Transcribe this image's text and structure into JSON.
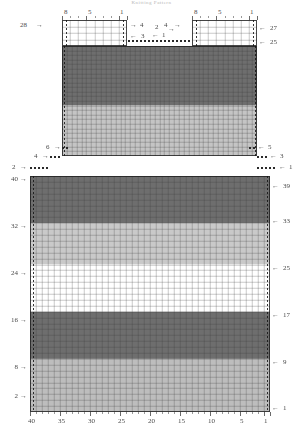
{
  "chart": {
    "title": "Knitting Pattern",
    "kind": "stitch-chart",
    "top_panel": {
      "left_block": {
        "column_labels": [
          "8",
          "5",
          "1"
        ],
        "row_label_left": "28",
        "row_labels_right": [
          "4",
          "3"
        ],
        "columns": 8,
        "rows": 4
      },
      "right_block": {
        "column_labels": [
          "8",
          "5",
          "1"
        ],
        "row_labels_left": [
          "4",
          "2"
        ],
        "row_labels_right": [
          "27",
          "25"
        ],
        "columns": 8,
        "rows": 4
      },
      "center_markers": [
        "1",
        "2"
      ]
    },
    "mid_panel": {
      "left_step_labels": [
        "6",
        "4",
        "2"
      ],
      "right_step_labels": [
        "5",
        "3",
        "1"
      ],
      "left_row_label": "40",
      "right_row_label": "39"
    },
    "main_grid": {
      "columns": 40,
      "rows": 40,
      "column_labels_bottom": [
        "40",
        "35",
        "30",
        "25",
        "20",
        "15",
        "10",
        "5",
        "1"
      ],
      "row_labels_left": [
        "40",
        "32",
        "24",
        "16",
        "8",
        "2"
      ],
      "row_labels_right": [
        "39",
        "33",
        "25",
        "17",
        "9",
        "1"
      ]
    }
  },
  "chart_data": {
    "type": "heatmap",
    "title": "Knitting Pattern",
    "xlabel": "",
    "ylabel": "",
    "grid": true,
    "legend": "none",
    "columns": 40,
    "rows": 40,
    "x_tick_labels": [
      "40",
      "35",
      "30",
      "25",
      "20",
      "15",
      "10",
      "5",
      "1"
    ],
    "y_tick_labels_left": [
      "40",
      "32",
      "24",
      "16",
      "8",
      "2"
    ],
    "y_tick_labels_right": [
      "39",
      "33",
      "25",
      "17",
      "9",
      "1"
    ],
    "colors": {
      "dark": "#6e6e6e",
      "mid": "#b4b4b4",
      "light": "#d6d6d6",
      "white": "#ffffff",
      "gridline": "#8a8a8a",
      "ink": "#333333"
    },
    "bands_main_grid": [
      {
        "from_row": 33,
        "to_row": 40,
        "color": "#6e6e6e",
        "name": "dark"
      },
      {
        "from_row": 26,
        "to_row": 32,
        "color": "#c9c9c9",
        "name": "light"
      },
      {
        "from_row": 18,
        "to_row": 25,
        "color": "#ffffff",
        "name": "white"
      },
      {
        "from_row": 10,
        "to_row": 17,
        "color": "#6e6e6e",
        "name": "dark"
      },
      {
        "from_row": 1,
        "to_row": 9,
        "color": "#bdbdbd",
        "name": "light"
      }
    ],
    "bands_top_panel": [
      {
        "from_row": 12,
        "to_row": 24,
        "color": "#6e6e6e",
        "name": "dark"
      },
      {
        "from_row": 1,
        "to_row": 11,
        "color": "#c4c4c4",
        "name": "light"
      }
    ]
  }
}
